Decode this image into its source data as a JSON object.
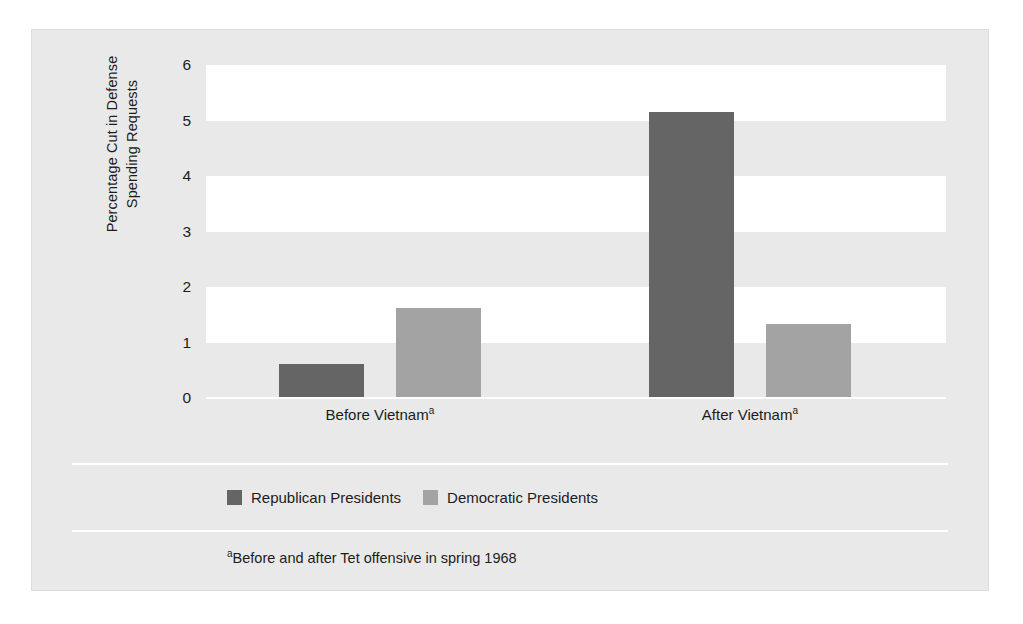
{
  "chart_data": {
    "type": "bar",
    "title": "",
    "xlabel": "",
    "ylabel": "Percentage Cut in Defense Spending Requests",
    "ylabel_line1": "Percentage Cut in Defense",
    "ylabel_line2": "Spending Requests",
    "categories": [
      "Before Vietnam",
      "After Vietnam"
    ],
    "category_superscript": "a",
    "ylim": [
      0,
      6
    ],
    "yticks": [
      6,
      5,
      4,
      3,
      2,
      1,
      0
    ],
    "ytick_labels": [
      "6",
      "5",
      "4",
      "3",
      "2",
      "1",
      "0"
    ],
    "grid": "alternating-horizontal-bands",
    "legend_position": "below-plot",
    "series": [
      {
        "name": "Republican Presidents",
        "color": "#656565",
        "values": [
          0.61,
          5.15
        ]
      },
      {
        "name": "Democratic Presidents",
        "color": "#a3a3a3",
        "values": [
          1.62,
          1.33
        ]
      }
    ],
    "annotations": [
      "aBefore and after Tet offensive in spring 1968"
    ]
  },
  "footnote": {
    "marker": "a",
    "text": "Before and after Tet offensive in spring 1968"
  },
  "colors": {
    "panel_background": "#e9e9e9",
    "band_white": "#ffffff",
    "republican": "#656565",
    "democratic": "#a3a3a3",
    "text": "#1c1c1c",
    "rule": "#ffffff"
  }
}
